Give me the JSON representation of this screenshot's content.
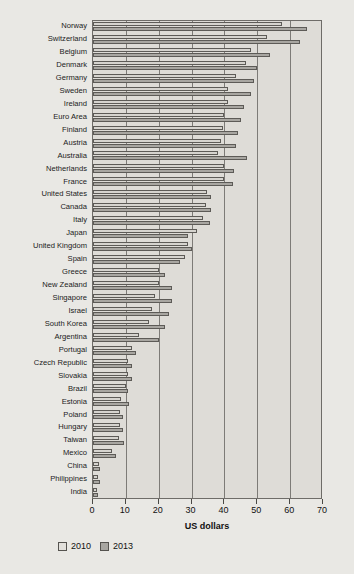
{
  "chart_data": {
    "type": "bar",
    "orientation": "horizontal",
    "title": "",
    "xlabel": "US dollars",
    "ylabel": "",
    "xlim": [
      0,
      70
    ],
    "xticks": [
      0,
      10,
      20,
      30,
      40,
      50,
      60,
      70
    ],
    "grid": true,
    "legend_position": "bottom-left",
    "categories": [
      "Norway",
      "Switzerland",
      "Belgium",
      "Denmark",
      "Germany",
      "Sweden",
      "Ireland",
      "Euro Area",
      "Finland",
      "Austria",
      "Australia",
      "Netherlands",
      "France",
      "United States",
      "Canada",
      "Italy",
      "Japan",
      "United Kingdom",
      "Spain",
      "Greece",
      "New Zealand",
      "Singapore",
      "Israel",
      "South Korea",
      "Argentina",
      "Portugal",
      "Czech Republic",
      "Slovakia",
      "Brazil",
      "Estonia",
      "Poland",
      "Hungary",
      "Taiwan",
      "Mexico",
      "China",
      "Philippines",
      "India"
    ],
    "series": [
      {
        "name": "2010",
        "color": "#d6d4cf",
        "values": [
          57.5,
          53.0,
          48.0,
          46.5,
          43.5,
          41.0,
          41.0,
          40.0,
          39.5,
          39.0,
          38.0,
          40.0,
          40.0,
          34.8,
          34.5,
          33.5,
          31.5,
          29.0,
          28.0,
          20.0,
          20.0,
          19.0,
          18.0,
          17.0,
          14.0,
          12.0,
          10.5,
          10.5,
          10.0,
          8.5,
          8.3,
          8.3,
          8.0,
          5.8,
          1.7,
          1.6,
          1.1
        ]
      },
      {
        "name": "2013",
        "color": "#a8a6a1",
        "values": [
          65.0,
          63.0,
          54.0,
          50.0,
          49.0,
          48.0,
          46.0,
          45.0,
          44.0,
          43.5,
          47.0,
          43.0,
          42.5,
          36.0,
          36.0,
          35.5,
          29.0,
          30.0,
          26.5,
          22.0,
          24.0,
          24.0,
          23.0,
          22.0,
          20.0,
          13.0,
          12.0,
          12.0,
          10.5,
          11.0,
          9.0,
          9.0,
          9.5,
          7.0,
          2.2,
          2.1,
          1.4
        ]
      }
    ]
  },
  "axis": {
    "tick_labels": [
      "0",
      "10",
      "20",
      "30",
      "40",
      "50",
      "60",
      "70"
    ],
    "title": "US dollars"
  },
  "legend": {
    "items": [
      {
        "label": "2010",
        "swatch": "light-gray-swatch"
      },
      {
        "label": "2013",
        "swatch": "dark-gray-swatch"
      }
    ]
  }
}
